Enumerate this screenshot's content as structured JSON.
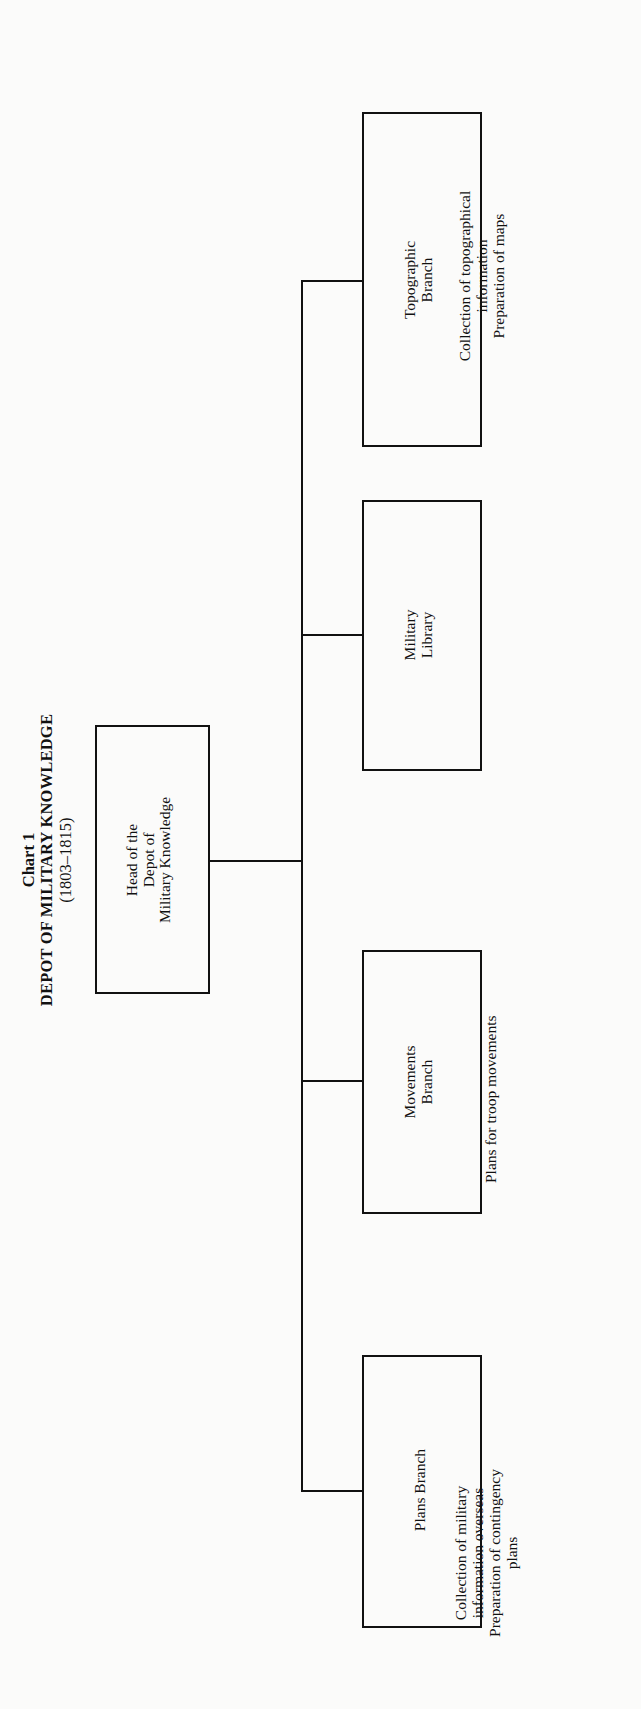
{
  "title": {
    "chart_label": "Chart 1",
    "name": "DEPOT OF MILITARY KNOWLEDGE",
    "years": "(1803–1815)"
  },
  "head": {
    "lines": [
      "Head of the",
      "Depot of",
      "Military Knowledge"
    ]
  },
  "branches": [
    {
      "name_lines": [
        "Topographic",
        "Branch"
      ],
      "description_lines": [
        "Collection of topographical",
        "information",
        "Preparation of maps"
      ]
    },
    {
      "name_lines": [
        "Military",
        "Library"
      ],
      "description_lines": []
    },
    {
      "name_lines": [
        "Movements",
        "Branch"
      ],
      "description_lines": [
        "Plans for troop movements"
      ]
    },
    {
      "name_lines": [
        "Plans Branch"
      ],
      "description_lines": [
        "Collection of military",
        "information overseas",
        "Preparation of contingency",
        "plans"
      ]
    }
  ]
}
